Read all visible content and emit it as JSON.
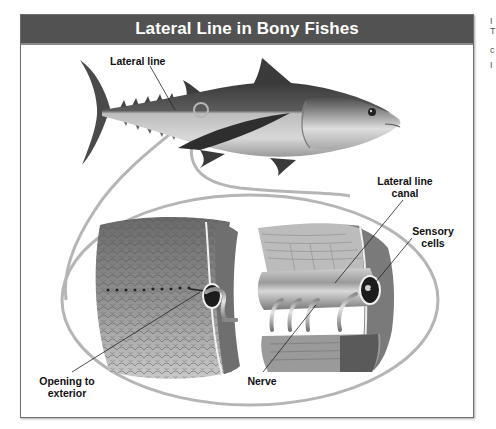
{
  "figure": {
    "title": "Lateral Line in Bony Fishes",
    "labels": {
      "lateral_line": "Lateral line",
      "lateral_line_canal": [
        "Lateral line",
        "canal"
      ],
      "sensory_cells": [
        "Sensory",
        "cells"
      ],
      "opening_to_exterior": [
        "Opening to",
        "exterior"
      ],
      "nerve": "Nerve"
    },
    "colors": {
      "header_bg": "#525252",
      "header_text": "#ffffff",
      "callout_ring": "#b5b5b5",
      "frame_border": "#6e6e6e"
    }
  },
  "edge_fragments": [
    "I",
    "T",
    "c",
    "I"
  ]
}
